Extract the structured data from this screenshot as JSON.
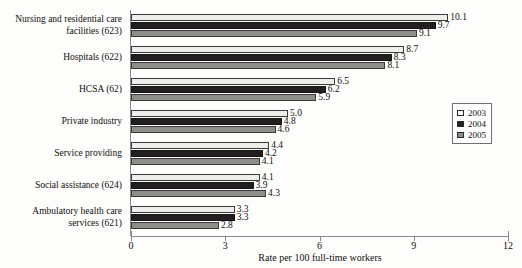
{
  "chart_data": {
    "type": "bar",
    "orientation": "horizontal",
    "title": "",
    "xlabel": "Rate per 100 full-time workers",
    "ylabel": "",
    "xlim": [
      0,
      12
    ],
    "xticks": [
      0,
      3,
      6,
      9,
      12
    ],
    "xtick_labels": [
      "0",
      "3",
      "6",
      "9",
      "12"
    ],
    "grid": false,
    "legend_position": "right",
    "categories": [
      "Nursing and residential care facilities (623)",
      "Hospitals (622)",
      "HCSA (62)",
      "Private industry",
      "Service providing",
      "Social assistance (624)",
      "Ambulatory health care services (621)"
    ],
    "category_lines": [
      [
        "Nursing and residential care",
        "facilities (623)"
      ],
      [
        "Hospitals (622)"
      ],
      [
        "HCSA (62)"
      ],
      [
        "Private industry"
      ],
      [
        "Service providing"
      ],
      [
        "Social assistance (624)"
      ],
      [
        "Ambulatory health care",
        "services (621)"
      ]
    ],
    "series": [
      {
        "name": "2003",
        "color": "#eeeeea",
        "values": [
          10.1,
          8.7,
          6.5,
          5.0,
          4.4,
          4.1,
          3.3
        ],
        "labels": [
          "10.1",
          "8.7",
          "6.5",
          "5.0",
          "4.4",
          "4.1",
          "3.3"
        ]
      },
      {
        "name": "2004",
        "color": "#231f20",
        "values": [
          9.7,
          8.3,
          6.2,
          4.8,
          4.2,
          3.9,
          3.3
        ],
        "labels": [
          "9.7",
          "8.3",
          "6.2",
          "4.8",
          "4.2",
          "3.9",
          "3.3"
        ]
      },
      {
        "name": "2005",
        "color": "#8d8d8a",
        "values": [
          9.1,
          8.1,
          5.9,
          4.6,
          4.1,
          4.3,
          2.8
        ],
        "labels": [
          "9.1",
          "8.1",
          "5.9",
          "4.6",
          "4.1",
          "4.3",
          "2.8"
        ]
      }
    ]
  },
  "legend": {
    "entries": [
      {
        "label": "2003",
        "swatch": "s0"
      },
      {
        "label": "2004",
        "swatch": "s1"
      },
      {
        "label": "2005",
        "swatch": "s2"
      }
    ]
  }
}
